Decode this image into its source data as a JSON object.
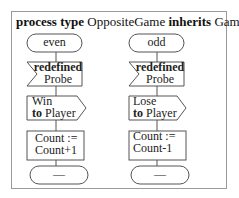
{
  "header": {
    "kw_process_type": "process type",
    "process_name": "OppositeGame",
    "kw_inherits": "inherits",
    "parent_name": "Game"
  },
  "columns": [
    {
      "state": "even",
      "input": {
        "keyword": "redefined",
        "signal": "Probe"
      },
      "output": {
        "signal": "Win",
        "kw_to": "to",
        "target": "Player"
      },
      "task": {
        "line1": "Count :=",
        "line2": "Count+1"
      },
      "nextstate": "—"
    },
    {
      "state": "odd",
      "input": {
        "keyword": "redefined",
        "signal": "Probe"
      },
      "output": {
        "signal": "Lose",
        "kw_to": "to",
        "target": "Player"
      },
      "task": {
        "line1": "Count :=",
        "line2": "Count-1"
      },
      "nextstate": "—"
    }
  ],
  "colors": {
    "stroke": "#555555",
    "frame": "#9a9a9a",
    "text": "#222222"
  }
}
